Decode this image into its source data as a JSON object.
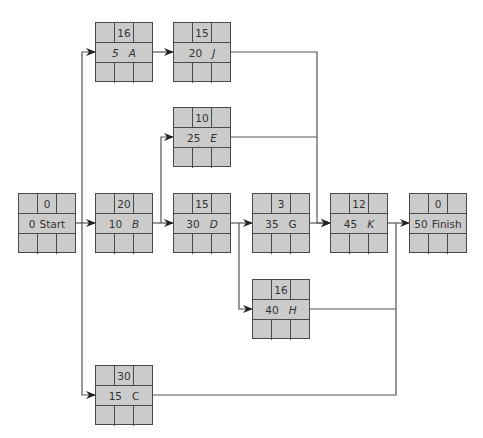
{
  "diagram": {
    "type": "activity-on-node network",
    "colors": {
      "node_fill": "#cbcbcb",
      "node_border": "#4a4a4a",
      "line": "#555555"
    },
    "nodes": {
      "start": {
        "id": "0",
        "name": "Start",
        "duration": "0"
      },
      "a": {
        "id": "5",
        "name": "A",
        "duration": "16"
      },
      "b": {
        "id": "10",
        "name": "B",
        "duration": "20"
      },
      "c": {
        "id": "15",
        "name": "C",
        "duration": "30"
      },
      "j": {
        "id": "20",
        "name": "J",
        "duration": "15"
      },
      "e": {
        "id": "25",
        "name": "E",
        "duration": "10"
      },
      "d": {
        "id": "30",
        "name": "D",
        "duration": "15"
      },
      "g": {
        "id": "35",
        "name": "G",
        "duration": "3"
      },
      "h": {
        "id": "40",
        "name": "H",
        "duration": "16"
      },
      "k": {
        "id": "45",
        "name": "K",
        "duration": "12"
      },
      "finish": {
        "id": "50",
        "name": "Finish",
        "duration": "0"
      }
    },
    "edges": [
      [
        "Start",
        "A"
      ],
      [
        "Start",
        "B"
      ],
      [
        "Start",
        "C"
      ],
      [
        "A",
        "J"
      ],
      [
        "B",
        "E"
      ],
      [
        "B",
        "D"
      ],
      [
        "D",
        "G"
      ],
      [
        "D",
        "H"
      ],
      [
        "J",
        "K"
      ],
      [
        "E",
        "K"
      ],
      [
        "G",
        "K"
      ],
      [
        "K",
        "Finish"
      ],
      [
        "H",
        "Finish"
      ],
      [
        "C",
        "Finish"
      ]
    ]
  }
}
